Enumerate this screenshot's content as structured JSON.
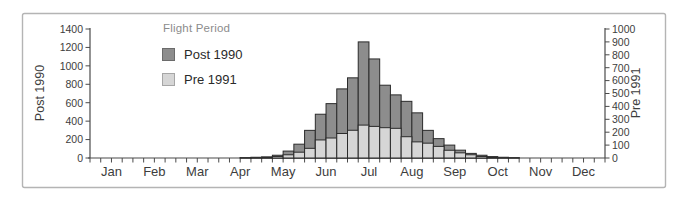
{
  "chart_data": {
    "type": "bar",
    "title": "",
    "legend": {
      "title": "Flight Period",
      "position": "upper-left-inside",
      "entries": [
        {
          "label": "Post 1990",
          "color": "#8d8d8d",
          "border": "#6b6b6b"
        },
        {
          "label": "Pre 1991",
          "color": "#d6d6d6",
          "border": "#a6a6a6"
        }
      ]
    },
    "x_axis": {
      "tick_labels": [
        "Jan",
        "Feb",
        "Mar",
        "Apr",
        "May",
        "Jun",
        "Jul",
        "Aug",
        "Sep",
        "Oct",
        "Nov",
        "Dec"
      ],
      "bins_per_month": 4
    },
    "left_axis": {
      "title": "Post 1990",
      "min": 0,
      "max": 1400,
      "tick_step": 200,
      "tick_labels": [
        "0",
        "200",
        "400",
        "600",
        "800",
        "1000",
        "1200",
        "1400"
      ]
    },
    "right_axis": {
      "title": "Pre 1991",
      "min": 0,
      "max": 1000,
      "tick_step": 100,
      "tick_labels": [
        "0",
        "100",
        "200",
        "300",
        "400",
        "500",
        "600",
        "700",
        "800",
        "900",
        "1000"
      ]
    },
    "grid": false,
    "bar_outline": "#2b2b2b",
    "overlay_note": "Pre 1991 bars drawn in front of Post 1990 bars; quarter-month bins",
    "series": [
      {
        "name": "Post 1990",
        "axis": "left",
        "color": "#8d8d8d",
        "values": [
          0,
          0,
          0,
          0,
          0,
          0,
          0,
          0,
          0,
          0,
          0,
          0,
          0,
          0,
          5,
          8,
          12,
          30,
          75,
          150,
          300,
          475,
          590,
          750,
          870,
          1260,
          1075,
          790,
          685,
          615,
          490,
          300,
          210,
          140,
          85,
          50,
          30,
          15,
          8,
          4,
          0,
          0,
          0,
          0,
          0,
          0,
          0,
          0
        ]
      },
      {
        "name": "Pre 1991",
        "axis": "right",
        "color": "#d6d6d6",
        "values": [
          0,
          0,
          0,
          0,
          0,
          0,
          0,
          0,
          0,
          0,
          0,
          0,
          0,
          0,
          2,
          3,
          5,
          12,
          25,
          45,
          75,
          140,
          155,
          190,
          215,
          255,
          245,
          235,
          230,
          165,
          125,
          115,
          90,
          60,
          40,
          25,
          12,
          6,
          3,
          2,
          0,
          0,
          0,
          0,
          0,
          0,
          0,
          0
        ]
      }
    ]
  }
}
